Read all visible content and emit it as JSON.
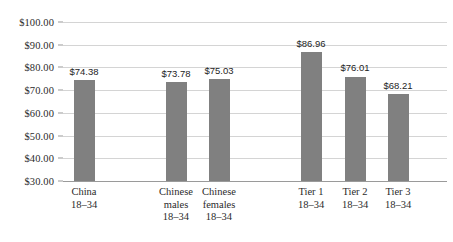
{
  "chart_data": {
    "type": "bar",
    "title": "",
    "subtitle": "",
    "xlabel": "",
    "ylabel": "",
    "ylim": [
      30,
      100
    ],
    "ytick_step": 10,
    "grid": true,
    "legend": false,
    "currency_prefix": "$",
    "categories": [
      "China 18–34",
      "Chinese males 18–34",
      "Chinese females 18–34",
      "Tier 1 18–34",
      "Tier 2 18–34",
      "Tier 3 18–34"
    ],
    "category_lines": [
      [
        "China",
        "18–34"
      ],
      [
        "Chinese",
        "males",
        "18–34"
      ],
      [
        "Chinese",
        "females",
        "18–34"
      ],
      [
        "Tier 1",
        "18–34"
      ],
      [
        "Tier 2",
        "18–34"
      ],
      [
        "Tier 3",
        "18–34"
      ]
    ],
    "values": [
      74.38,
      73.78,
      75.03,
      86.96,
      76.01,
      68.21
    ],
    "data_labels": [
      "$74.38",
      "$73.78",
      "$75.03",
      "$86.96",
      "$76.01",
      "$68.21"
    ],
    "ytick_labels": [
      "$100.00",
      "$90.00",
      "$80.00",
      "$70.00",
      "$60.00",
      "$50.00",
      "$40.00",
      "$30.00"
    ],
    "ytick_values": [
      100,
      90,
      80,
      70,
      60,
      50,
      40,
      30
    ],
    "bar_color": "#808080",
    "gridline_color": "#d4d4d4",
    "axis_color": "#9a9a9a",
    "text_color": "#2b2b2b",
    "background_color": "#ffffff"
  },
  "layout": {
    "bar_centers_px": [
      84,
      176,
      219,
      311,
      355,
      398
    ],
    "bar_width_px": 21,
    "plot_left_px": 63,
    "plot_top_px": 22,
    "plot_width_px": 384,
    "plot_height_px": 159
  }
}
